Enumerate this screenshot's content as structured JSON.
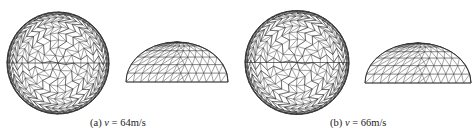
{
  "figure": {
    "panels": [
      {
        "id": "a",
        "label": "(a)",
        "var": "v",
        "eq": " = ",
        "value": "64m/s"
      },
      {
        "id": "b",
        "label": "(b)",
        "var": "v",
        "eq": " = ",
        "value": "66m/s"
      }
    ]
  },
  "colors": {
    "mesh": "#333333",
    "background": "#ffffff"
  }
}
